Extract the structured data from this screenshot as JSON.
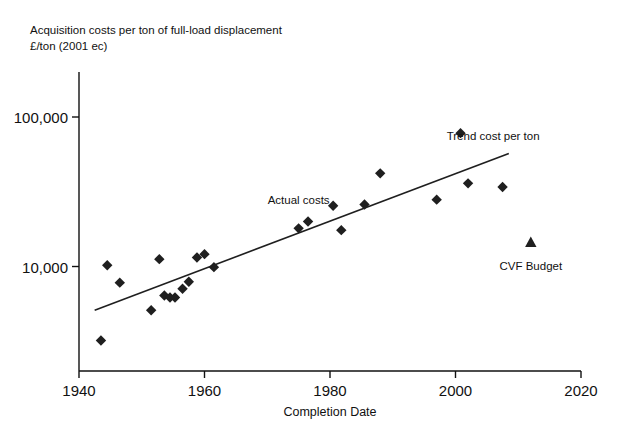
{
  "chart_data": {
    "type": "scatter",
    "title": "Acquisition costs per ton of full-load displacement",
    "subtitle": "£/ton (2001 ec)",
    "xlabel": "Completion Date",
    "ylabel": "",
    "yscale": "log",
    "xlim": [
      1940,
      2020
    ],
    "ylim": [
      2000,
      200000
    ],
    "xticks": [
      "1940",
      "1960",
      "1980",
      "2000",
      "2020"
    ],
    "xtick_values": [
      1940,
      1960,
      1980,
      2000,
      2020
    ],
    "yticks": [
      "10,000",
      "100,000"
    ],
    "ytick_values": [
      10000,
      100000
    ],
    "grid": false,
    "legend_position": "inline-annotations",
    "annotations": [
      {
        "name": "actual-costs-label",
        "text": "Actual costs",
        "x": 1975,
        "y": 26000
      },
      {
        "name": "trend-line-label",
        "text": "Trend cost per ton",
        "x": 2006,
        "y": 70000
      },
      {
        "name": "cvf-budget-label",
        "text": "CVF Budget",
        "x": 2012,
        "y": 9500
      }
    ],
    "series": [
      {
        "name": "Actual costs",
        "marker": "diamond",
        "color": "#1f1f1f",
        "points": [
          {
            "x": 1943.5,
            "y": 3200
          },
          {
            "x": 1944.5,
            "y": 10200
          },
          {
            "x": 1946.5,
            "y": 7800
          },
          {
            "x": 1951.5,
            "y": 5100
          },
          {
            "x": 1952.8,
            "y": 11200
          },
          {
            "x": 1953.6,
            "y": 6400
          },
          {
            "x": 1954.5,
            "y": 6200
          },
          {
            "x": 1955.3,
            "y": 6200
          },
          {
            "x": 1956.5,
            "y": 7100
          },
          {
            "x": 1957.5,
            "y": 7900
          },
          {
            "x": 1958.8,
            "y": 11500
          },
          {
            "x": 1960.0,
            "y": 12100
          },
          {
            "x": 1961.5,
            "y": 9900
          },
          {
            "x": 1975.0,
            "y": 18000
          },
          {
            "x": 1976.5,
            "y": 20000
          },
          {
            "x": 1980.5,
            "y": 25500
          },
          {
            "x": 1981.8,
            "y": 17500
          },
          {
            "x": 1985.5,
            "y": 26000
          },
          {
            "x": 1988.0,
            "y": 42000
          },
          {
            "x": 1997.0,
            "y": 28000
          },
          {
            "x": 2000.8,
            "y": 78000
          },
          {
            "x": 2002.0,
            "y": 36000
          },
          {
            "x": 2007.5,
            "y": 34000
          }
        ]
      },
      {
        "name": "CVF Budget",
        "marker": "triangle",
        "color": "#1f1f1f",
        "points": [
          {
            "x": 2012.0,
            "y": 14500
          }
        ]
      }
    ],
    "trendline": {
      "name": "Trend cost per ton",
      "color": "#1f1f1f",
      "start": {
        "x": 1942.5,
        "y": 5100
      },
      "end": {
        "x": 2008.5,
        "y": 57000
      }
    }
  }
}
